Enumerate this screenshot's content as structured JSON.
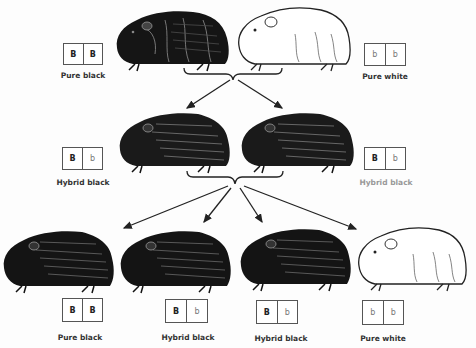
{
  "diagram": {
    "colors": {
      "ink": "#111111",
      "box_border": "#555555",
      "label": "#333333",
      "background": "#fdfdfd"
    },
    "parents": [
      {
        "coat": "black",
        "genotype": [
          "B",
          "B"
        ],
        "label": "Pure black"
      },
      {
        "coat": "white",
        "genotype": [
          "b",
          "b"
        ],
        "label": "Pure white"
      }
    ],
    "f1": [
      {
        "coat": "black",
        "genotype": [
          "B",
          "b"
        ],
        "label": "Hybrid black"
      },
      {
        "coat": "black",
        "genotype": [
          "B",
          "b"
        ],
        "label": "Hybrid black"
      }
    ],
    "f2": [
      {
        "coat": "black",
        "genotype": [
          "B",
          "B"
        ],
        "label": "Pure black"
      },
      {
        "coat": "black",
        "genotype": [
          "B",
          "b"
        ],
        "label": "Hybrid black"
      },
      {
        "coat": "black",
        "genotype": [
          "B",
          "b"
        ],
        "label": "Hybrid black"
      },
      {
        "coat": "white",
        "genotype": [
          "b",
          "b"
        ],
        "label": "Pure white"
      }
    ],
    "connectors": {
      "parents_to_f1": {
        "type": "brace-with-arrows",
        "arrow_count": 2
      },
      "f1_to_f2": {
        "type": "brace-with-arrows",
        "arrow_count": 4
      }
    }
  }
}
